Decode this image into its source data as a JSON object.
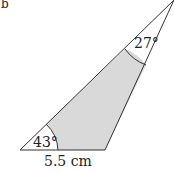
{
  "diagram": {
    "part_label": "b",
    "angle_bottom_left": "43°",
    "angle_top": "27°",
    "base_length": "5.5 cm",
    "colors": {
      "stroke": "#333333",
      "shade": "#d9d9d9"
    }
  }
}
